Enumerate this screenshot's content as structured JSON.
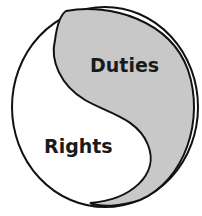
{
  "diagram": {
    "type": "yin-yang",
    "regions": [
      {
        "label": "Duties",
        "fill": "#c8c8c8"
      },
      {
        "label": "Rights",
        "fill": "#ffffff"
      }
    ],
    "stroke": "#111111"
  }
}
